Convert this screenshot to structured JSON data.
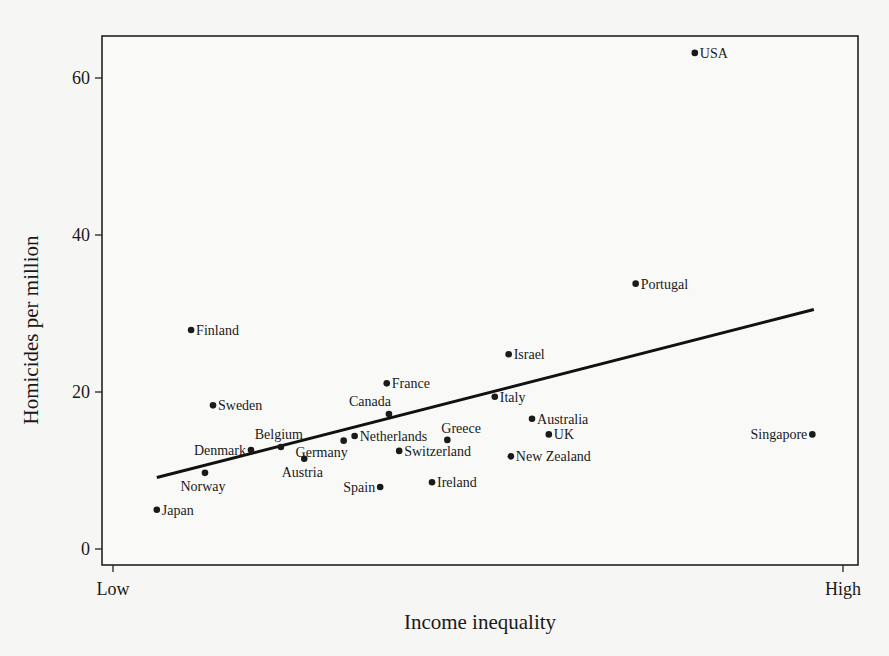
{
  "chart_data": {
    "type": "scatter",
    "title": "",
    "xlabel": "Income inequality",
    "ylabel": "Homicides per million",
    "x_tick_labels": [
      "Low",
      "High"
    ],
    "xlim": [
      0,
      1
    ],
    "ylim": [
      -2,
      64
    ],
    "y_ticks": [
      0,
      20,
      40,
      60
    ],
    "grid": false,
    "legend": null,
    "colors": {
      "points": "#1a1a1a",
      "trend": "#111111",
      "frame": "#222222",
      "background": "#f6f6f4"
    },
    "trend_line": {
      "x": [
        0.06,
        0.96
      ],
      "y": [
        9.1,
        30.5
      ]
    },
    "points": [
      {
        "label": "USA",
        "x": 0.797,
        "y": 63.2,
        "label_pos": "right"
      },
      {
        "label": "Portugal",
        "x": 0.716,
        "y": 33.8,
        "label_pos": "right"
      },
      {
        "label": "Finland",
        "x": 0.107,
        "y": 27.9,
        "label_pos": "right"
      },
      {
        "label": "Israel",
        "x": 0.542,
        "y": 24.8,
        "label_pos": "right"
      },
      {
        "label": "France",
        "x": 0.375,
        "y": 21.1,
        "label_pos": "right"
      },
      {
        "label": "Italy",
        "x": 0.523,
        "y": 19.4,
        "label_pos": "right"
      },
      {
        "label": "Sweden",
        "x": 0.137,
        "y": 18.3,
        "label_pos": "right"
      },
      {
        "label": "Canada",
        "x": 0.378,
        "y": 17.2,
        "label_pos": "above-left"
      },
      {
        "label": "Australia",
        "x": 0.574,
        "y": 16.6,
        "label_pos": "right"
      },
      {
        "label": "UK",
        "x": 0.597,
        "y": 14.6,
        "label_pos": "right"
      },
      {
        "label": "Singapore",
        "x": 0.958,
        "y": 14.6,
        "label_pos": "left"
      },
      {
        "label": "Netherlands",
        "x": 0.331,
        "y": 14.4,
        "label_pos": "right"
      },
      {
        "label": "Greece",
        "x": 0.458,
        "y": 13.9,
        "label_pos": "above-right"
      },
      {
        "label": "Germany",
        "x": 0.316,
        "y": 13.8,
        "label_pos": "below-left"
      },
      {
        "label": "Belgium",
        "x": 0.23,
        "y": 13.0,
        "label_pos": "above"
      },
      {
        "label": "Denmark",
        "x": 0.189,
        "y": 12.6,
        "label_pos": "left"
      },
      {
        "label": "Switzerland",
        "x": 0.392,
        "y": 12.5,
        "label_pos": "right"
      },
      {
        "label": "New Zealand",
        "x": 0.545,
        "y": 11.8,
        "label_pos": "right"
      },
      {
        "label": "Austria",
        "x": 0.262,
        "y": 11.5,
        "label_pos": "below"
      },
      {
        "label": "Norway",
        "x": 0.126,
        "y": 9.7,
        "label_pos": "below"
      },
      {
        "label": "Ireland",
        "x": 0.437,
        "y": 8.5,
        "label_pos": "right"
      },
      {
        "label": "Spain",
        "x": 0.366,
        "y": 7.9,
        "label_pos": "left"
      },
      {
        "label": "Japan",
        "x": 0.06,
        "y": 5.0,
        "label_pos": "right"
      }
    ]
  }
}
